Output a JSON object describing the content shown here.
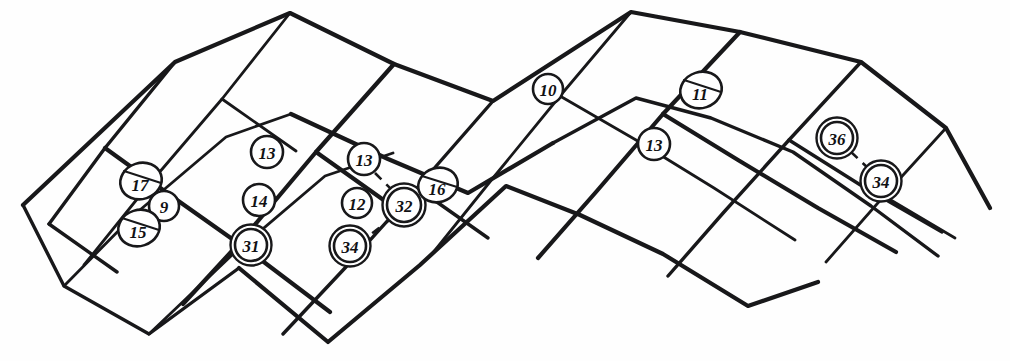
{
  "figure": {
    "title": "Warped quadrilateral mesh with numbered node markers",
    "width": 1010,
    "height": 361,
    "background_color": "#fefefe",
    "line_color": "#18181a",
    "label_color": "#111114"
  },
  "chart_data": {
    "type": "diagram",
    "title": "Warped quadrilateral mesh with numbered node markers",
    "xlabel": "",
    "ylabel": "",
    "grid": true,
    "legend": "none",
    "xlim": [
      0,
      1010
    ],
    "ylim": [
      0,
      361
    ],
    "marker_styles": {
      "single": "single thin circle outline",
      "double": "two concentric circle outlines",
      "chord": "single circle outline with a straight chord drawn across its upper-left to lower-right region"
    },
    "nodes": [
      {
        "label": "17",
        "x": 141,
        "y": 181,
        "style": "chord",
        "radius": 19
      },
      {
        "label": "9",
        "x": 164,
        "y": 206,
        "style": "single",
        "radius": 15
      },
      {
        "label": "15",
        "x": 139,
        "y": 228,
        "style": "chord",
        "radius": 19
      },
      {
        "label": "13",
        "x": 267,
        "y": 152,
        "style": "single",
        "radius": 16
      },
      {
        "label": "14",
        "x": 259,
        "y": 200,
        "style": "single",
        "radius": 16
      },
      {
        "label": "31",
        "x": 251,
        "y": 245,
        "style": "double",
        "radius": 16
      },
      {
        "label": "13",
        "x": 364,
        "y": 159,
        "style": "single",
        "radius": 16
      },
      {
        "label": "12",
        "x": 357,
        "y": 203,
        "style": "single",
        "radius": 15
      },
      {
        "label": "34",
        "x": 350,
        "y": 246,
        "style": "double",
        "radius": 16
      },
      {
        "label": "32",
        "x": 404,
        "y": 205,
        "style": "double",
        "radius": 17
      },
      {
        "label": "16",
        "x": 438,
        "y": 185,
        "style": "chord",
        "radius": 18
      },
      {
        "label": "10",
        "x": 548,
        "y": 89,
        "style": "single",
        "radius": 15
      },
      {
        "label": "11",
        "x": 701,
        "y": 90,
        "style": "chord",
        "radius": 19
      },
      {
        "label": "13",
        "x": 654,
        "y": 144,
        "style": "single",
        "radius": 16
      },
      {
        "label": "36",
        "x": 837,
        "y": 138,
        "style": "double",
        "radius": 16
      },
      {
        "label": "34",
        "x": 881,
        "y": 181,
        "style": "double",
        "radius": 16
      }
    ],
    "dashed_links": [
      {
        "from": "13",
        "to": "32",
        "x1": 375,
        "y1": 173,
        "x2": 394,
        "y2": 192
      },
      {
        "from": "32",
        "to": "34",
        "x1": 392,
        "y1": 218,
        "x2": 366,
        "y2": 238
      },
      {
        "from": "36",
        "to": "34",
        "x1": 851,
        "y1": 152,
        "x2": 868,
        "y2": 168
      }
    ],
    "node_count": 16,
    "values": [
      17,
      9,
      15,
      13,
      14,
      31,
      13,
      12,
      34,
      32,
      16,
      10,
      11,
      13,
      36,
      34
    ],
    "mesh_paths": [
      "M23,205 L175,62 L290,13 L394,64 L493,101 L631,12 L740,32 L861,62 L946,128 L990,208",
      "M23,205 L64,286 L149,334 L239,268",
      "M64,286 L134,215 L226,137 L291,114",
      "M291,114 L388,159 L468,193 L553,143",
      "M553,143 L636,98 L711,118 L793,152 L871,206 L938,256",
      "M149,334 L231,256 L325,176 L393,153",
      "M239,268 L328,342 L420,265 L506,186 L580,215 L663,254 L748,306 L818,282",
      "M175,62 L105,148 L49,224",
      "M290,13 L222,99 L146,188 L84,265",
      "M394,64 L316,152 L242,240 L183,304",
      "M493,101 L417,188 L345,268 L283,334",
      "M631,12 L560,96 L493,178 L432,254",
      "M740,32 L663,114 L596,192 L538,258",
      "M861,62 L789,140 L724,212 L668,276",
      "M946,128 L884,196 L826,262",
      "M105,148 L177,200 L252,253 L330,312",
      "M49,224 L117,272",
      "M222,99 L296,151",
      "M316,152 L392,206",
      "M417,188 L488,238",
      "M560,96 L636,140 L714,188 L795,240",
      "M663,114 L738,160 L818,208 L896,252",
      "M789,140 L862,186 L942,232",
      "M884,196 L955,238"
    ]
  }
}
